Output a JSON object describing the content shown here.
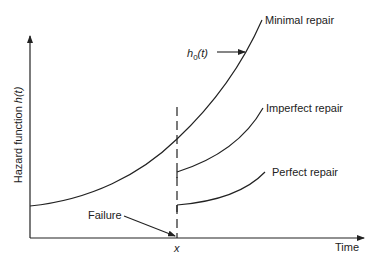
{
  "diagram": {
    "type": "hazard-function-repair-diagram",
    "axes": {
      "y_label_prefix": "Hazard function ",
      "y_label_var": "h(t)",
      "x_label": "Time",
      "x_marker": "x"
    },
    "curves": [
      {
        "id": "minimal",
        "label": "Minimal repair"
      },
      {
        "id": "imperfect",
        "label": "Imperfect repair"
      },
      {
        "id": "perfect",
        "label": "Perfect repair"
      }
    ],
    "annotations": {
      "baseline_hazard": "h",
      "baseline_hazard_sub": "0",
      "baseline_hazard_arg": "(t)",
      "failure": "Failure"
    },
    "colors": {
      "line": "#222222",
      "background": "#ffffff"
    }
  }
}
